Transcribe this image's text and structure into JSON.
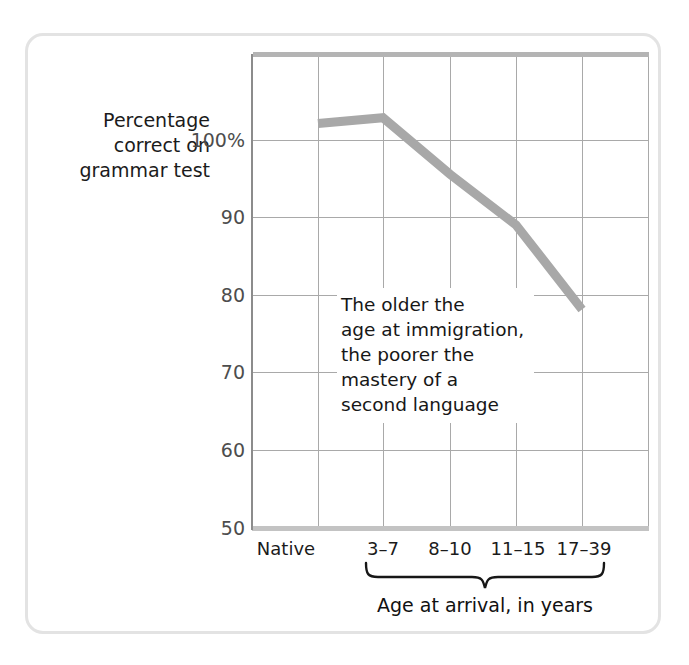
{
  "chart_data": {
    "type": "line",
    "title": "",
    "subtitle": "",
    "xlabel": "Age at arrival, in years",
    "ylabel": "Percentage correct on grammar test",
    "categories": [
      "Native",
      "3–7",
      "8–10",
      "11–15",
      "17–39"
    ],
    "values": [
      98,
      98.7,
      92,
      86,
      76
    ],
    "series": [
      {
        "name": "Percentage correct on grammar test",
        "values": [
          98,
          98.7,
          92,
          86,
          76
        ],
        "color": "#a8a8a8"
      }
    ],
    "ylim": [
      50,
      106
    ],
    "ytick_values": [
      100,
      90,
      80,
      70,
      60,
      50
    ],
    "ytick_labels": [
      "100%",
      "90",
      "80",
      "70",
      "60",
      "50"
    ],
    "grid": true,
    "legend": "none",
    "annotations": [
      {
        "text": "The older the\nage at immigration,\nthe poorer the\nmastery of a\nsecond language"
      }
    ],
    "axis_bracket_label": "Age at arrival, in years",
    "axis_bracket_covers": [
      "3–7",
      "8–10",
      "11–15",
      "17–39"
    ],
    "colors": {
      "line": "#a8a8a8",
      "grid": "#a9a9a9",
      "axis": "#8c8c8c",
      "frame": "#e3e3e3",
      "text": "#1b1b1b",
      "tick_text": "#4d4d4d"
    }
  },
  "figure": {
    "ylabel_lines": [
      "Percentage",
      "correct on",
      "grammar test"
    ],
    "ylabel_text": "Percentage correct on grammar test",
    "xlabel_text": "Age at arrival, in years",
    "annotation_text": "The older the\nage at immigration,\nthe poorer the\nmastery of a\nsecond language",
    "ytick_labels": [
      "100%",
      "90",
      "80",
      "70",
      "60",
      "50"
    ],
    "xtick_labels": [
      "Native",
      "3–7",
      "8–10",
      "11–15",
      "17–39"
    ]
  }
}
